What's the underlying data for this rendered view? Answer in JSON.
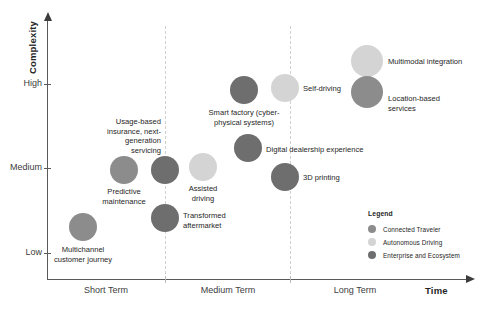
{
  "chart_data": {
    "type": "scatter",
    "title": "",
    "xlabel": "Time",
    "ylabel": "Complexity",
    "grid": "vertical-dashed-dividers",
    "legend_position": "inside-bottom-right",
    "x_tick_labels": [
      "Short Term",
      "Medium Term",
      "Long Term"
    ],
    "y_tick_labels": [
      "High",
      "Medium",
      "Low"
    ],
    "xlim": [
      0,
      3
    ],
    "ylim": [
      0,
      3
    ],
    "categories": [
      {
        "key": "connected_traveler",
        "name": "Connected Traveler",
        "color": "#8c8c8c"
      },
      {
        "key": "autonomous_driving",
        "name": "Autonomous Driving",
        "color": "#d4d4d4"
      },
      {
        "key": "enterprise_ecosystem",
        "name": "Enterprise and Ecosystem",
        "color": "#6e6e6e"
      }
    ],
    "points": [
      {
        "label": "Multichannel\ncustomer journey",
        "category": "connected_traveler",
        "x_band": "Short Term",
        "y_band": "Low",
        "px": 83,
        "py": 227,
        "r": 14,
        "label_x": 83,
        "label_y": 245,
        "label_align": "center"
      },
      {
        "label": "Predictive\nmaintenance",
        "category": "connected_traveler",
        "x_band": "Short Term",
        "y_band": "Medium",
        "px": 124,
        "py": 170,
        "r": 14,
        "label_x": 124,
        "label_y": 187,
        "label_align": "center"
      },
      {
        "label": "Transformed\naftermarket",
        "category": "enterprise_ecosystem",
        "x_band": "Short Term / Medium Term boundary",
        "y_band": "Low-Medium",
        "px": 165,
        "py": 218,
        "r": 14,
        "label_x": 183,
        "label_y": 211,
        "label_align": "left"
      },
      {
        "label": "Usage-based\ninsurance, next-\ngeneration\nservicing",
        "category": "enterprise_ecosystem",
        "x_band": "Short Term / Medium Term boundary",
        "y_band": "Medium",
        "px": 165,
        "py": 170,
        "r": 14,
        "label_x": 161,
        "label_y": 117,
        "label_align": "right"
      },
      {
        "label": "Assisted\ndriving",
        "category": "autonomous_driving",
        "x_band": "Medium Term",
        "y_band": "Medium",
        "px": 203,
        "py": 167,
        "r": 14,
        "label_x": 203,
        "label_y": 184,
        "label_align": "center"
      },
      {
        "label": "Smart factory (cyber-\nphysical systems)",
        "category": "enterprise_ecosystem",
        "x_band": "Medium Term",
        "y_band": "High",
        "px": 244,
        "py": 90,
        "r": 14,
        "label_x": 244,
        "label_y": 108,
        "label_align": "center"
      },
      {
        "label": "Digital dealership experience",
        "category": "enterprise_ecosystem",
        "x_band": "Medium Term",
        "y_band": "Medium",
        "px": 248,
        "py": 148,
        "r": 14,
        "label_x": 266,
        "label_y": 145,
        "label_align": "left"
      },
      {
        "label": "3D printing",
        "category": "enterprise_ecosystem",
        "x_band": "Medium Term",
        "y_band": "Medium-Low",
        "px": 285,
        "py": 177,
        "r": 14,
        "label_x": 303,
        "label_y": 173,
        "label_align": "left"
      },
      {
        "label": "Self-driving",
        "category": "autonomous_driving",
        "x_band": "Medium Term / Long Term boundary",
        "y_band": "High",
        "px": 285,
        "py": 88,
        "r": 14,
        "label_x": 303,
        "label_y": 84,
        "label_align": "left"
      },
      {
        "label": "Multimodal integration",
        "category": "autonomous_driving",
        "x_band": "Long Term",
        "y_band": "High+",
        "px": 367,
        "py": 61,
        "r": 16,
        "label_x": 388,
        "label_y": 57,
        "label_align": "left"
      },
      {
        "label": "Location-based\nservices",
        "category": "connected_traveler",
        "x_band": "Long Term",
        "y_band": "High",
        "px": 367,
        "py": 92,
        "r": 16,
        "label_x": 388,
        "label_y": 94,
        "label_align": "left"
      }
    ]
  },
  "axes": {
    "y_title": "Complexity",
    "x_title": "Time",
    "y_ticks": [
      {
        "label": "High",
        "py": 84
      },
      {
        "label": "Medium",
        "py": 168
      },
      {
        "label": "Low",
        "py": 253
      }
    ],
    "x_ticks": [
      {
        "label": "Short Term",
        "px": 106
      },
      {
        "label": "Medium Term",
        "px": 228
      },
      {
        "label": "Long Term",
        "px": 355
      }
    ]
  },
  "legend": {
    "title": "Legend",
    "items": [
      {
        "label": "Connected Traveler",
        "color": "#8c8c8c"
      },
      {
        "label": "Autonomous Driving",
        "color": "#d4d4d4"
      },
      {
        "label": "Enterprise and Ecosystem",
        "color": "#6e6e6e"
      }
    ]
  }
}
